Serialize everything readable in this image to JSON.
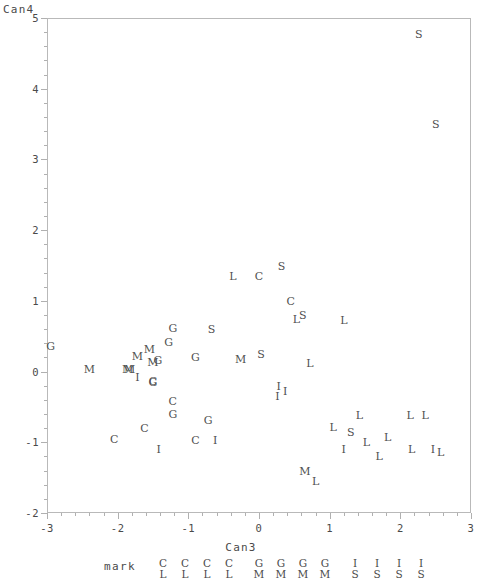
{
  "chart_data": {
    "type": "scatter",
    "title": "",
    "xlabel": "Can3",
    "ylabel": "Can4",
    "xlim": [
      -3,
      3
    ],
    "ylim": [
      -2,
      5
    ],
    "xticks": [
      -3,
      -2,
      -1,
      0,
      1,
      2,
      3
    ],
    "yticks": [
      -2,
      -1,
      0,
      1,
      2,
      3,
      4,
      5
    ],
    "xtick_labels": [
      "-3",
      "-2",
      "-1",
      "0",
      "1",
      "2",
      "3"
    ],
    "ytick_labels": [
      "-2",
      "-1",
      "0",
      "1",
      "2",
      "3",
      "4",
      "5"
    ],
    "grid": false,
    "minor_ticks": true,
    "legend": {
      "title": "mark",
      "position": "below-axis",
      "entries": [
        {
          "top": "C",
          "bottom": "L"
        },
        {
          "top": "C",
          "bottom": "L"
        },
        {
          "top": "C",
          "bottom": "L"
        },
        {
          "top": "C",
          "bottom": "L"
        },
        {
          "top": "G",
          "bottom": "M"
        },
        {
          "top": "G",
          "bottom": "M"
        },
        {
          "top": "G",
          "bottom": "M"
        },
        {
          "top": "G",
          "bottom": "M"
        },
        {
          "top": "I",
          "bottom": "S"
        },
        {
          "top": "I",
          "bottom": "S"
        },
        {
          "top": "I",
          "bottom": "S"
        },
        {
          "top": "I",
          "bottom": "S"
        }
      ]
    },
    "point_labels": [
      "C",
      "G",
      "I",
      "L",
      "M",
      "S"
    ],
    "points": [
      {
        "label": "S",
        "x": 2.26,
        "y": 4.78
      },
      {
        "label": "S",
        "x": 2.5,
        "y": 3.5
      },
      {
        "label": "S",
        "x": 0.32,
        "y": 1.5
      },
      {
        "label": "L",
        "x": -0.37,
        "y": 1.35
      },
      {
        "label": "C",
        "x": 0.0,
        "y": 1.35
      },
      {
        "label": "C",
        "x": 0.45,
        "y": 1.0
      },
      {
        "label": "L",
        "x": 0.53,
        "y": 0.75
      },
      {
        "label": "S",
        "x": 0.62,
        "y": 0.8
      },
      {
        "label": "L",
        "x": 1.2,
        "y": 0.73
      },
      {
        "label": "G",
        "x": -1.22,
        "y": 0.62
      },
      {
        "label": "S",
        "x": -0.67,
        "y": 0.6
      },
      {
        "label": "G",
        "x": -1.28,
        "y": 0.42
      },
      {
        "label": "G",
        "x": -2.95,
        "y": 0.36
      },
      {
        "label": "M",
        "x": -1.55,
        "y": 0.32
      },
      {
        "label": "M",
        "x": -1.72,
        "y": 0.22
      },
      {
        "label": "S",
        "x": 0.03,
        "y": 0.25
      },
      {
        "label": "G",
        "x": -0.9,
        "y": 0.2
      },
      {
        "label": "M",
        "x": -0.26,
        "y": 0.18
      },
      {
        "label": "G",
        "x": -1.43,
        "y": 0.16
      },
      {
        "label": "M",
        "x": -1.5,
        "y": 0.13
      },
      {
        "label": "L",
        "x": 0.72,
        "y": 0.12
      },
      {
        "label": "M",
        "x": -2.4,
        "y": 0.03
      },
      {
        "label": "M",
        "x": -1.83,
        "y": 0.03
      },
      {
        "label": "M",
        "x": -1.86,
        "y": 0.03
      },
      {
        "label": "I",
        "x": -1.72,
        "y": -0.08
      },
      {
        "label": "C",
        "x": -1.5,
        "y": -0.13
      },
      {
        "label": "G",
        "x": -1.5,
        "y": -0.15
      },
      {
        "label": "I",
        "x": 0.28,
        "y": -0.2
      },
      {
        "label": "I",
        "x": 0.37,
        "y": -0.27
      },
      {
        "label": "I",
        "x": 0.26,
        "y": -0.35
      },
      {
        "label": "C",
        "x": -1.22,
        "y": -0.42
      },
      {
        "label": "G",
        "x": -1.22,
        "y": -0.6
      },
      {
        "label": "G",
        "x": -0.72,
        "y": -0.68
      },
      {
        "label": "L",
        "x": 1.42,
        "y": -0.62
      },
      {
        "label": "L",
        "x": 2.14,
        "y": -0.62
      },
      {
        "label": "L",
        "x": 2.35,
        "y": -0.62
      },
      {
        "label": "L",
        "x": 1.05,
        "y": -0.78
      },
      {
        "label": "S",
        "x": 1.3,
        "y": -0.85
      },
      {
        "label": "C",
        "x": -1.62,
        "y": -0.8
      },
      {
        "label": "L",
        "x": 1.82,
        "y": -0.93
      },
      {
        "label": "C",
        "x": -2.05,
        "y": -0.95
      },
      {
        "label": "C",
        "x": -0.9,
        "y": -0.97
      },
      {
        "label": "I",
        "x": -0.62,
        "y": -0.97
      },
      {
        "label": "L",
        "x": 1.52,
        "y": -1.0
      },
      {
        "label": "I",
        "x": -1.42,
        "y": -1.1
      },
      {
        "label": "I",
        "x": 1.2,
        "y": -1.1
      },
      {
        "label": "L",
        "x": 2.16,
        "y": -1.1
      },
      {
        "label": "I",
        "x": 2.46,
        "y": -1.1
      },
      {
        "label": "L",
        "x": 2.57,
        "y": -1.14
      },
      {
        "label": "L",
        "x": 1.7,
        "y": -1.2
      },
      {
        "label": "M",
        "x": 0.65,
        "y": -1.4
      },
      {
        "label": "L",
        "x": 0.8,
        "y": -1.55
      }
    ]
  }
}
